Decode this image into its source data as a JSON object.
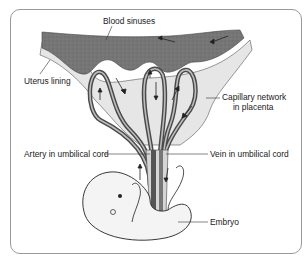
{
  "diagram": {
    "labels": {
      "blood_sinuses": "Blood sinuses",
      "uterus_lining": "Uterus lining",
      "capillary_network_line1": "Capillary network",
      "capillary_network_line2": "in placenta",
      "artery": "Artery in umbilical cord",
      "vein": "Vein in umbilical cord",
      "embryo": "Embryo"
    },
    "colors": {
      "sinus_fill": "#7a7a7a",
      "lining_fill": "#e4e4e4",
      "vessel_dark": "#555555",
      "vessel_light": "#bdbdbd",
      "embryo_fill": "#f4f4f4",
      "outline": "#333333",
      "frame": "#9a9a9a"
    }
  }
}
